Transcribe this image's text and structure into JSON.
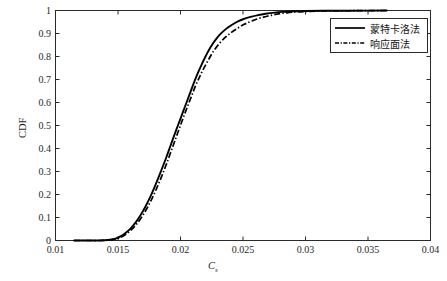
{
  "chart_data": {
    "type": "line",
    "title": "",
    "subtitle": "",
    "xlabel": "C",
    "xlabel_sub": "s",
    "ylabel": "CDF",
    "xlim": [
      0.01,
      0.04
    ],
    "ylim": [
      0,
      1
    ],
    "grid": false,
    "legend_position": "upper right",
    "xticks": [
      "0.01",
      "0.015",
      "0.02",
      "0.025",
      "0.03",
      "0.035",
      "0.04"
    ],
    "xtick_values": [
      0.01,
      0.015,
      0.02,
      0.025,
      0.03,
      0.035,
      0.04
    ],
    "yticks": [
      "0",
      "0.1",
      "0.2",
      "0.3",
      "0.4",
      "0.5",
      "0.6",
      "0.7",
      "0.8",
      "0.9",
      "1"
    ],
    "ytick_values": [
      0,
      0.1,
      0.2,
      0.3,
      0.4,
      0.5,
      0.6,
      0.7,
      0.8,
      0.9,
      1.0
    ],
    "series": [
      {
        "name": "蒙特卡洛法",
        "style": "solid",
        "color": "#000000",
        "x": [
          0.0115,
          0.0125,
          0.0135,
          0.0142,
          0.0148,
          0.0152,
          0.0156,
          0.016,
          0.0164,
          0.0168,
          0.0172,
          0.0176,
          0.018,
          0.0184,
          0.0188,
          0.0192,
          0.0196,
          0.02,
          0.0204,
          0.0208,
          0.0211,
          0.0214,
          0.0217,
          0.022,
          0.0224,
          0.0228,
          0.0232,
          0.0236,
          0.024,
          0.0245,
          0.025,
          0.0256,
          0.0262,
          0.0268,
          0.0275,
          0.0282,
          0.029,
          0.03,
          0.0315,
          0.0335,
          0.0365
        ],
        "y": [
          0.0,
          0.0,
          0.0,
          0.002,
          0.008,
          0.018,
          0.033,
          0.052,
          0.078,
          0.11,
          0.148,
          0.192,
          0.242,
          0.296,
          0.352,
          0.412,
          0.472,
          0.53,
          0.588,
          0.646,
          0.69,
          0.73,
          0.766,
          0.8,
          0.84,
          0.872,
          0.898,
          0.918,
          0.934,
          0.95,
          0.962,
          0.972,
          0.98,
          0.986,
          0.991,
          0.994,
          0.996,
          0.998,
          0.999,
          0.999,
          1.0
        ]
      },
      {
        "name": "响应面法",
        "style": "dashdot",
        "color": "#000000",
        "x": [
          0.0115,
          0.0125,
          0.0135,
          0.0143,
          0.0149,
          0.0153,
          0.0157,
          0.0161,
          0.0165,
          0.0169,
          0.0173,
          0.0177,
          0.0181,
          0.0185,
          0.0189,
          0.0193,
          0.0197,
          0.0201,
          0.0205,
          0.0209,
          0.0212,
          0.0215,
          0.0218,
          0.0222,
          0.0226,
          0.0231,
          0.0236,
          0.0241,
          0.0246,
          0.0251,
          0.0257,
          0.0263,
          0.027,
          0.0277,
          0.0285,
          0.0293,
          0.0302,
          0.0315,
          0.0335,
          0.0365
        ],
        "y": [
          0.0,
          0.0,
          0.0,
          0.002,
          0.008,
          0.016,
          0.03,
          0.048,
          0.072,
          0.102,
          0.138,
          0.18,
          0.228,
          0.28,
          0.336,
          0.396,
          0.456,
          0.516,
          0.574,
          0.63,
          0.672,
          0.708,
          0.742,
          0.782,
          0.82,
          0.856,
          0.884,
          0.906,
          0.924,
          0.94,
          0.954,
          0.966,
          0.976,
          0.984,
          0.99,
          0.994,
          0.996,
          0.998,
          0.999,
          1.0
        ]
      }
    ]
  },
  "axes": {
    "ylabel": "CDF",
    "xlabel_main": "C",
    "xlabel_subscript": "s"
  },
  "legend": {
    "items": [
      {
        "label": "蒙特卡洛法",
        "style": "solid"
      },
      {
        "label": "响应面法",
        "style": "dashdot"
      }
    ]
  },
  "colors": {
    "axis": "#2a2a2a",
    "curve": "#000000",
    "background": "#ffffff"
  }
}
